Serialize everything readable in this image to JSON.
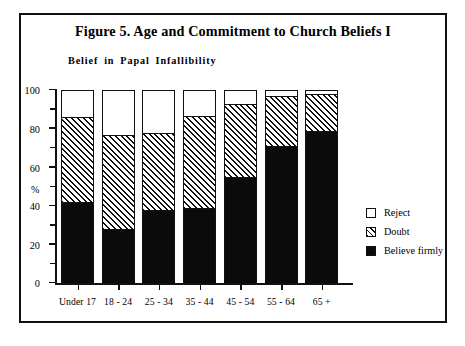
{
  "figure": {
    "title": "Figure 5. Age and Commitment to Church Beliefs I",
    "subtitle": "Belief  in  Papal  Infallibility"
  },
  "chart_data": {
    "type": "bar",
    "subtype": "stacked-vertical-100",
    "title": "Figure 5. Age and Commitment to Church Beliefs I",
    "subtitle": "Belief in Papal Infallibility",
    "xlabel": "",
    "ylabel": "%",
    "ylim": [
      0,
      100
    ],
    "ytick_labels": [
      "0",
      "20",
      "40",
      "60",
      "80",
      "100"
    ],
    "ytick_values": [
      0,
      20,
      40,
      60,
      80,
      100
    ],
    "yminor_step": 10,
    "grid": false,
    "legend_position": "right",
    "categories": [
      "Under 17",
      "18 - 24",
      "25 - 34",
      "35 - 44",
      "45 - 54",
      "55 - 64",
      "65 +"
    ],
    "series": [
      {
        "name": "Believe firmly",
        "fill": "solid-black",
        "values": [
          42,
          28,
          38,
          39,
          55,
          71,
          79
        ]
      },
      {
        "name": "Doubt",
        "fill": "diagonal-hatch",
        "values": [
          44,
          49,
          40,
          48,
          38,
          26,
          19
        ]
      },
      {
        "name": "Reject",
        "fill": "white",
        "values": [
          14,
          23,
          22,
          13,
          7,
          3,
          2
        ]
      }
    ],
    "stack_tops": {
      "believe_firmly": [
        42,
        28,
        38,
        39,
        55,
        71,
        79
      ],
      "believe_plus_doubt": [
        86,
        77,
        78,
        87,
        93,
        97,
        98
      ],
      "total": [
        100,
        100,
        100,
        100,
        100,
        100,
        100
      ]
    },
    "legend": [
      {
        "label": "Reject",
        "swatch": "white"
      },
      {
        "label": "Doubt",
        "swatch": "hatched"
      },
      {
        "label": "Believe firmly",
        "swatch": "black"
      }
    ],
    "colors": {
      "ink": "#111111",
      "fill_solid": "#0b0b0b",
      "fill_empty": "#ffffff"
    }
  }
}
